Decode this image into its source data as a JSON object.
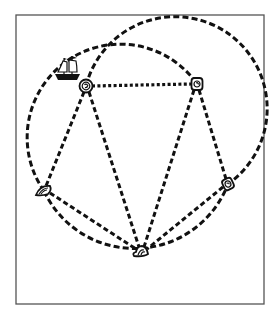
{
  "diagram": {
    "type": "graph-map",
    "frame": {
      "x": 16,
      "y": 15,
      "width": 248,
      "height": 289,
      "stroke": "#555555"
    },
    "line_color": "#111111",
    "nodes": [
      {
        "id": "A",
        "label": "",
        "icon": "rose-knot-icon",
        "x": 86,
        "y": 86,
        "has_ship": true
      },
      {
        "id": "B",
        "label": "",
        "icon": "rose-knot-icon",
        "x": 197,
        "y": 84
      },
      {
        "id": "C",
        "label": "",
        "icon": "shell-icon",
        "x": 44,
        "y": 191
      },
      {
        "id": "D",
        "label": "",
        "icon": "rose-knot-icon",
        "x": 228,
        "y": 184
      },
      {
        "id": "E",
        "label": "",
        "icon": "shell-icon",
        "x": 141,
        "y": 252
      }
    ],
    "edges": [
      {
        "from": "A",
        "to": "B",
        "style": "dotted-straight"
      },
      {
        "from": "A",
        "to": "C",
        "style": "dashed-straight"
      },
      {
        "from": "A",
        "to": "E",
        "style": "dashed-straight"
      },
      {
        "from": "B",
        "to": "E",
        "style": "dashed-straight"
      },
      {
        "from": "B",
        "to": "D",
        "style": "dashed-straight"
      },
      {
        "from": "C",
        "to": "E",
        "style": "dashed-straight"
      },
      {
        "from": "D",
        "to": "E",
        "style": "dashed-straight"
      }
    ],
    "arcs": [
      {
        "from": "C",
        "to": "B",
        "via": "left-and-top",
        "style": "dashed-curve"
      },
      {
        "from": "A",
        "to": "D",
        "via": "top-and-right",
        "style": "dashed-curve"
      },
      {
        "from": "C",
        "to": "D",
        "via": "bottom",
        "style": "dashed-curve"
      }
    ],
    "ship": {
      "icon": "sailing-ship-icon",
      "near_node": "A",
      "x": 68,
      "y": 70
    }
  }
}
